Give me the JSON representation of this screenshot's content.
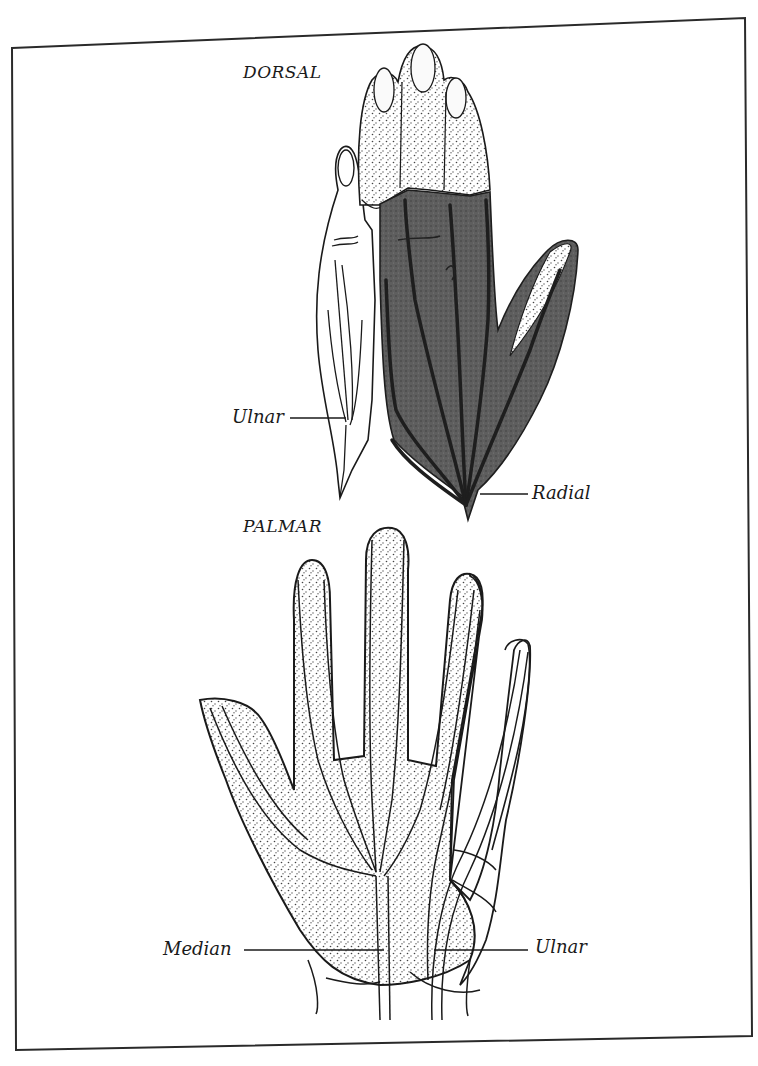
{
  "figure": {
    "type": "anatomical-illustration",
    "frame_color": "#2a2a2a",
    "shading": {
      "radial_zone": "#5e5e5e",
      "radial_zone_dark_lines": "#1e1e1e",
      "stipple_zone": "#d8d8d8",
      "outline": "#1a1a1a",
      "background": "#ffffff"
    }
  },
  "dorsal": {
    "title": "DORSAL",
    "labels": {
      "ulnar": "Ulnar",
      "radial": "Radial"
    }
  },
  "palmar": {
    "title": "PALMAR",
    "labels": {
      "median": "Median",
      "ulnar": "Ulnar"
    }
  }
}
